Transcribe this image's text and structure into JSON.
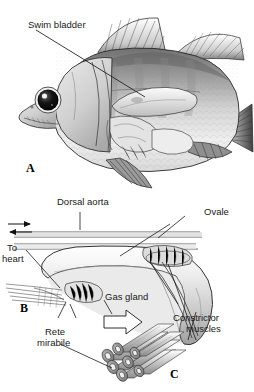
{
  "figure": {
    "type": "anatomical-diagram",
    "background": "#ffffff",
    "ink": "#1a1a1a"
  },
  "panels": [
    {
      "id": "A",
      "letter": "A",
      "caption": "Lateral view of fish showing swim bladder position"
    },
    {
      "id": "B",
      "letter": "B",
      "caption": "Detail of swim bladder with vasculature"
    },
    {
      "id": "C",
      "letter": "C",
      "caption": "Rete mirabile capillary bundle"
    }
  ],
  "labels": {
    "swim_bladder": "Swim bladder",
    "dorsal_aorta": "Dorsal aorta",
    "ovale": "Ovale",
    "to_heart_line1": "To",
    "to_heart_line2": "heart",
    "gas_gland": "Gas gland",
    "constrictor_line1": "Constrictor",
    "constrictor_line2": "muscles",
    "rete_line1": "Rete",
    "rete_line2": "mirabile"
  },
  "flow_arrows": [
    {
      "name": "arrow-right-dorsal-aorta",
      "direction": "right"
    },
    {
      "name": "arrow-left-to-heart",
      "direction": "left"
    }
  ],
  "colors": {
    "ink": "#1a1a1a",
    "body_light": "#f2f2f2",
    "body_mid": "#b9b9b9",
    "body_dark": "#6e6e6e",
    "fin_dark": "#4a4a4a",
    "eye": "#111111"
  }
}
